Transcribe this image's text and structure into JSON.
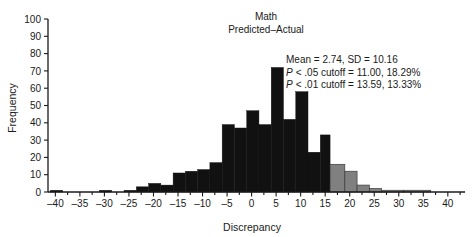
{
  "chart_data": {
    "type": "bar",
    "title": "Math",
    "subtitle": "Predicted–Actual",
    "xlabel": "Discrepancy",
    "ylabel": "Frequency",
    "xlim": [
      -41.5,
      43.5
    ],
    "ylim": [
      0,
      100
    ],
    "xticks": [
      -40,
      -35,
      -30,
      -25,
      -20,
      -15,
      -10,
      -5,
      0,
      5,
      10,
      15,
      20,
      25,
      30,
      35,
      40
    ],
    "yticks": [
      0,
      10,
      20,
      30,
      40,
      50,
      60,
      70,
      80,
      90,
      100
    ],
    "xtick_labels": [
      "–40",
      "–35",
      "–30",
      "–25",
      "–20",
      "–15",
      "–10",
      "–5",
      "0",
      "5",
      "10",
      "15",
      "20",
      "25",
      "30",
      "35",
      "40"
    ],
    "ytick_labels": [
      "0",
      "10",
      "20",
      "30",
      "40",
      "50",
      "60",
      "70",
      "80",
      "90",
      "100"
    ],
    "grid": false,
    "legend": "none",
    "bin_width": 2.5,
    "cutoff_x": 16,
    "colors": {
      "below_cutoff": "#111111",
      "above_cutoff": "#808080",
      "axis": "#1a1a1a",
      "background": "#ffffff"
    },
    "bins": [
      {
        "x0": -41.0,
        "x1": -38.5,
        "value": 1,
        "color": "below_cutoff"
      },
      {
        "x0": -38.5,
        "x1": -36.0,
        "value": 0,
        "color": "below_cutoff"
      },
      {
        "x0": -36.0,
        "x1": -33.5,
        "value": 0,
        "color": "below_cutoff"
      },
      {
        "x0": -33.5,
        "x1": -31.0,
        "value": 0,
        "color": "below_cutoff"
      },
      {
        "x0": -31.0,
        "x1": -28.5,
        "value": 1,
        "color": "below_cutoff"
      },
      {
        "x0": -28.5,
        "x1": -26.0,
        "value": 0,
        "color": "below_cutoff"
      },
      {
        "x0": -26.0,
        "x1": -23.5,
        "value": 1,
        "color": "below_cutoff"
      },
      {
        "x0": -23.5,
        "x1": -21.0,
        "value": 3,
        "color": "below_cutoff"
      },
      {
        "x0": -21.0,
        "x1": -18.5,
        "value": 5,
        "color": "below_cutoff"
      },
      {
        "x0": -18.5,
        "x1": -16.0,
        "value": 4,
        "color": "below_cutoff"
      },
      {
        "x0": -16.0,
        "x1": -13.5,
        "value": 11,
        "color": "below_cutoff"
      },
      {
        "x0": -13.5,
        "x1": -11.0,
        "value": 12,
        "color": "below_cutoff"
      },
      {
        "x0": -11.0,
        "x1": -8.5,
        "value": 13,
        "color": "below_cutoff"
      },
      {
        "x0": -8.5,
        "x1": -6.0,
        "value": 17,
        "color": "below_cutoff"
      },
      {
        "x0": -6.0,
        "x1": -3.5,
        "value": 39,
        "color": "below_cutoff"
      },
      {
        "x0": -3.5,
        "x1": -1.0,
        "value": 37,
        "color": "below_cutoff"
      },
      {
        "x0": -1.0,
        "x1": 1.5,
        "value": 47,
        "color": "below_cutoff"
      },
      {
        "x0": 1.5,
        "x1": 4.0,
        "value": 39,
        "color": "below_cutoff"
      },
      {
        "x0": 4.0,
        "x1": 6.5,
        "value": 72,
        "color": "below_cutoff"
      },
      {
        "x0": 6.5,
        "x1": 9.0,
        "value": 42,
        "color": "below_cutoff"
      },
      {
        "x0": 9.0,
        "x1": 11.5,
        "value": 58,
        "color": "below_cutoff"
      },
      {
        "x0": 11.5,
        "x1": 14.0,
        "value": 23,
        "color": "below_cutoff"
      },
      {
        "x0": 14.0,
        "x1": 16.0,
        "value": 33,
        "color": "below_cutoff"
      },
      {
        "x0": 16.0,
        "x1": 19.0,
        "value": 16,
        "color": "above_cutoff"
      },
      {
        "x0": 19.0,
        "x1": 21.5,
        "value": 12,
        "color": "above_cutoff"
      },
      {
        "x0": 21.5,
        "x1": 24.0,
        "value": 4,
        "color": "above_cutoff"
      },
      {
        "x0": 24.0,
        "x1": 26.5,
        "value": 2,
        "color": "above_cutoff"
      },
      {
        "x0": 26.5,
        "x1": 31.0,
        "value": 1,
        "color": "above_cutoff"
      },
      {
        "x0": 31.0,
        "x1": 36.5,
        "value": 1,
        "color": "above_cutoff"
      }
    ],
    "annotations": [
      {
        "id": "stats-mean-sd",
        "text": "Mean = 2.74, SD = 10.16",
        "italic_prefix": ""
      },
      {
        "id": "stats-cutoff-05",
        "text": "< .05 cutoff = 11.00, 18.29%",
        "italic_prefix": "P"
      },
      {
        "id": "stats-cutoff-01",
        "text": "< .01 cutoff = 13.59, 13.33%",
        "italic_prefix": "P"
      }
    ]
  }
}
